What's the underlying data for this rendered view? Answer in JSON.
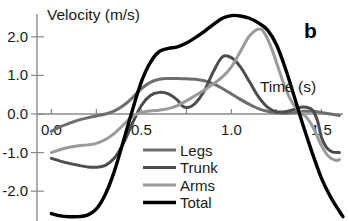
{
  "chart_data": {
    "type": "line",
    "title": "",
    "panel_label": "b",
    "xlabel": "Time (s)",
    "ylabel": "Velocity (m/s)",
    "xlim": [
      -0.08,
      1.62
    ],
    "ylim": [
      -2.85,
      2.75
    ],
    "xticks": [
      0.0,
      0.25,
      0.5,
      0.75,
      1.0,
      1.25,
      1.5
    ],
    "xtick_labels": [
      "0.0",
      "",
      "0.5",
      "",
      "1.0",
      "",
      "1.5"
    ],
    "yticks": [
      -2.0,
      -1.0,
      0.0,
      1.0,
      2.0
    ],
    "ytick_labels": [
      "-2.0",
      "-1.0",
      "0.0",
      "1.0",
      "2.0"
    ],
    "grid": false,
    "legend_position": "bottom-center",
    "series": [
      {
        "name": "Legs",
        "color": "#6e6e6e",
        "width": 3.0,
        "points": [
          [
            0.0,
            -0.45
          ],
          [
            0.05,
            -0.33
          ],
          [
            0.1,
            -0.24
          ],
          [
            0.15,
            -0.16
          ],
          [
            0.2,
            -0.1
          ],
          [
            0.25,
            -0.05
          ],
          [
            0.3,
            0.0
          ],
          [
            0.35,
            0.08
          ],
          [
            0.4,
            0.22
          ],
          [
            0.45,
            0.42
          ],
          [
            0.5,
            0.66
          ],
          [
            0.55,
            0.82
          ],
          [
            0.6,
            0.9
          ],
          [
            0.65,
            0.92
          ],
          [
            0.7,
            0.92
          ],
          [
            0.75,
            0.91
          ],
          [
            0.8,
            0.9
          ],
          [
            0.85,
            0.86
          ],
          [
            0.9,
            0.78
          ],
          [
            0.95,
            0.66
          ],
          [
            1.0,
            0.52
          ],
          [
            1.05,
            0.38
          ],
          [
            1.1,
            0.25
          ],
          [
            1.15,
            0.14
          ],
          [
            1.2,
            0.07
          ],
          [
            1.25,
            0.03
          ],
          [
            1.3,
            0.02
          ],
          [
            1.35,
            0.04
          ],
          [
            1.4,
            0.07
          ],
          [
            1.45,
            0.07
          ],
          [
            1.5,
            0.04
          ],
          [
            1.55,
            0.0
          ],
          [
            1.6,
            -0.04
          ]
        ]
      },
      {
        "name": "Trunk",
        "color": "#4d4d4d",
        "width": 3.0,
        "points": [
          [
            0.0,
            -1.15
          ],
          [
            0.05,
            -1.22
          ],
          [
            0.1,
            -1.28
          ],
          [
            0.15,
            -1.33
          ],
          [
            0.2,
            -1.37
          ],
          [
            0.25,
            -1.38
          ],
          [
            0.3,
            -1.33
          ],
          [
            0.35,
            -1.14
          ],
          [
            0.4,
            -0.76
          ],
          [
            0.45,
            -0.24
          ],
          [
            0.5,
            0.22
          ],
          [
            0.55,
            0.48
          ],
          [
            0.6,
            0.56
          ],
          [
            0.65,
            0.52
          ],
          [
            0.7,
            0.36
          ],
          [
            0.73,
            0.2
          ],
          [
            0.76,
            0.17
          ],
          [
            0.8,
            0.28
          ],
          [
            0.85,
            0.6
          ],
          [
            0.9,
            1.1
          ],
          [
            0.95,
            1.48
          ],
          [
            1.0,
            1.46
          ],
          [
            1.05,
            1.22
          ],
          [
            1.1,
            0.84
          ],
          [
            1.15,
            0.45
          ],
          [
            1.2,
            0.18
          ],
          [
            1.25,
            0.06
          ],
          [
            1.3,
            0.06
          ],
          [
            1.35,
            0.12
          ],
          [
            1.4,
            0.18
          ],
          [
            1.45,
            0.1
          ],
          [
            1.48,
            -0.2
          ],
          [
            1.5,
            -0.6
          ],
          [
            1.53,
            -0.88
          ],
          [
            1.56,
            -0.98
          ],
          [
            1.6,
            -1.0
          ]
        ]
      },
      {
        "name": "Arms",
        "color": "#9a9a9a",
        "width": 3.0,
        "points": [
          [
            0.0,
            -1.0
          ],
          [
            0.05,
            -0.92
          ],
          [
            0.1,
            -0.86
          ],
          [
            0.15,
            -0.82
          ],
          [
            0.2,
            -0.8
          ],
          [
            0.25,
            -0.76
          ],
          [
            0.3,
            -0.66
          ],
          [
            0.35,
            -0.5
          ],
          [
            0.4,
            -0.28
          ],
          [
            0.45,
            -0.06
          ],
          [
            0.5,
            0.04
          ],
          [
            0.55,
            0.08
          ],
          [
            0.6,
            0.1
          ],
          [
            0.65,
            0.14
          ],
          [
            0.7,
            0.22
          ],
          [
            0.75,
            0.34
          ],
          [
            0.8,
            0.48
          ],
          [
            0.85,
            0.62
          ],
          [
            0.9,
            0.78
          ],
          [
            0.95,
            0.96
          ],
          [
            1.0,
            1.22
          ],
          [
            1.05,
            1.62
          ],
          [
            1.1,
            2.02
          ],
          [
            1.15,
            2.2
          ],
          [
            1.18,
            2.12
          ],
          [
            1.22,
            1.74
          ],
          [
            1.26,
            1.2
          ],
          [
            1.3,
            0.66
          ],
          [
            1.34,
            0.28
          ],
          [
            1.38,
            0.06
          ],
          [
            1.42,
            -0.1
          ],
          [
            1.46,
            -0.4
          ],
          [
            1.5,
            -0.82
          ],
          [
            1.54,
            -1.1
          ],
          [
            1.58,
            -1.2
          ],
          [
            1.6,
            -1.18
          ]
        ]
      },
      {
        "name": "Total",
        "color": "#000000",
        "width": 3.4,
        "points": [
          [
            0.0,
            -2.58
          ],
          [
            0.05,
            -2.64
          ],
          [
            0.1,
            -2.66
          ],
          [
            0.15,
            -2.66
          ],
          [
            0.2,
            -2.62
          ],
          [
            0.25,
            -2.46
          ],
          [
            0.3,
            -2.08
          ],
          [
            0.35,
            -1.48
          ],
          [
            0.4,
            -0.7
          ],
          [
            0.45,
            0.1
          ],
          [
            0.5,
            0.84
          ],
          [
            0.55,
            1.34
          ],
          [
            0.6,
            1.62
          ],
          [
            0.65,
            1.7
          ],
          [
            0.7,
            1.74
          ],
          [
            0.75,
            1.84
          ],
          [
            0.8,
            1.98
          ],
          [
            0.85,
            2.14
          ],
          [
            0.9,
            2.32
          ],
          [
            0.95,
            2.48
          ],
          [
            1.0,
            2.55
          ],
          [
            1.05,
            2.54
          ],
          [
            1.1,
            2.48
          ],
          [
            1.15,
            2.36
          ],
          [
            1.2,
            2.18
          ],
          [
            1.25,
            1.8
          ],
          [
            1.3,
            1.18
          ],
          [
            1.35,
            0.44
          ],
          [
            1.4,
            -0.32
          ],
          [
            1.45,
            -1.02
          ],
          [
            1.5,
            -1.66
          ],
          [
            1.55,
            -2.14
          ],
          [
            1.6,
            -2.52
          ],
          [
            1.62,
            -2.66
          ]
        ]
      }
    ],
    "legend": [
      {
        "label": "Legs",
        "color": "#6e6e6e"
      },
      {
        "label": "Trunk",
        "color": "#4d4d4d"
      },
      {
        "label": "Arms",
        "color": "#9a9a9a"
      },
      {
        "label": "Total",
        "color": "#000000"
      }
    ]
  }
}
